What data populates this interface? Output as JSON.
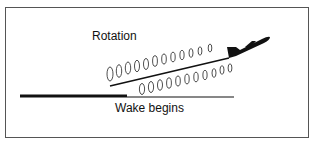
{
  "diagram": {
    "labels": {
      "rotation": "Rotation",
      "wake_begins": "Wake begins"
    },
    "elements": {
      "runway": "runway-line",
      "aircraft": "airplane-silhouette",
      "flight_path": "climb-path-line",
      "vortices_upper": 12,
      "vortices_lower": 11
    },
    "colors": {
      "ink": "#111111",
      "frame": "#555555",
      "background": "#ffffff"
    }
  }
}
